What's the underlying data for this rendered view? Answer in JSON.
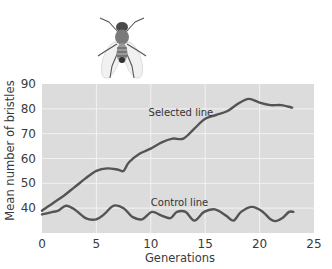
{
  "chart_data": {
    "type": "line",
    "title": "",
    "xlabel": "Generations",
    "ylabel": "Mean number of bristles",
    "xlim": [
      0,
      25
    ],
    "ylim": [
      30,
      90
    ],
    "x_ticks": [
      0,
      5,
      10,
      15,
      20,
      25
    ],
    "y_ticks": [
      40,
      50,
      60,
      70,
      80,
      90
    ],
    "grid": true,
    "legend": "none (inline annotations)",
    "colors": {
      "plot_bg": "#dcdcdc",
      "grid": "#f2f2f2",
      "line": "#545454",
      "text": "#3a3a3a"
    },
    "illustration": "fruit-fly (Drosophila) drawing above plot",
    "series": [
      {
        "name": "Selected line",
        "label_pos": [
          9.8,
          77
        ],
        "x": [
          0,
          1,
          2,
          3,
          4,
          5,
          6,
          7,
          7.5,
          8,
          9,
          10,
          11,
          12,
          13,
          14,
          15,
          16,
          17,
          18,
          19,
          20,
          21,
          22,
          23
        ],
        "values": [
          39,
          42,
          45,
          48.5,
          52,
          55,
          56,
          55.5,
          55,
          58.5,
          62,
          64,
          66.5,
          68,
          68,
          72,
          76,
          77.5,
          79,
          82,
          84,
          82.5,
          81.5,
          81.5,
          80.5
        ]
      },
      {
        "name": "Control line",
        "label_pos": [
          10,
          41
        ],
        "x": [
          0,
          1,
          1.5,
          2.2,
          3,
          4,
          5,
          5.7,
          6.6,
          7.5,
          8.3,
          9.2,
          10.1,
          11,
          11.8,
          12.4,
          13.2,
          14,
          14.9,
          15.9,
          16.9,
          17.6,
          18.3,
          19.3,
          20.3,
          21,
          21.5,
          22.1,
          22.7,
          23.1
        ],
        "values": [
          37.5,
          38.5,
          39,
          41,
          39.5,
          36,
          35.5,
          37.5,
          41,
          40,
          36.5,
          35.5,
          38.5,
          37,
          36,
          38.5,
          38.5,
          35,
          38.5,
          39.5,
          37,
          35,
          38.5,
          40.5,
          38.5,
          35.5,
          34.8,
          36,
          38.5,
          38.5
        ]
      }
    ]
  }
}
